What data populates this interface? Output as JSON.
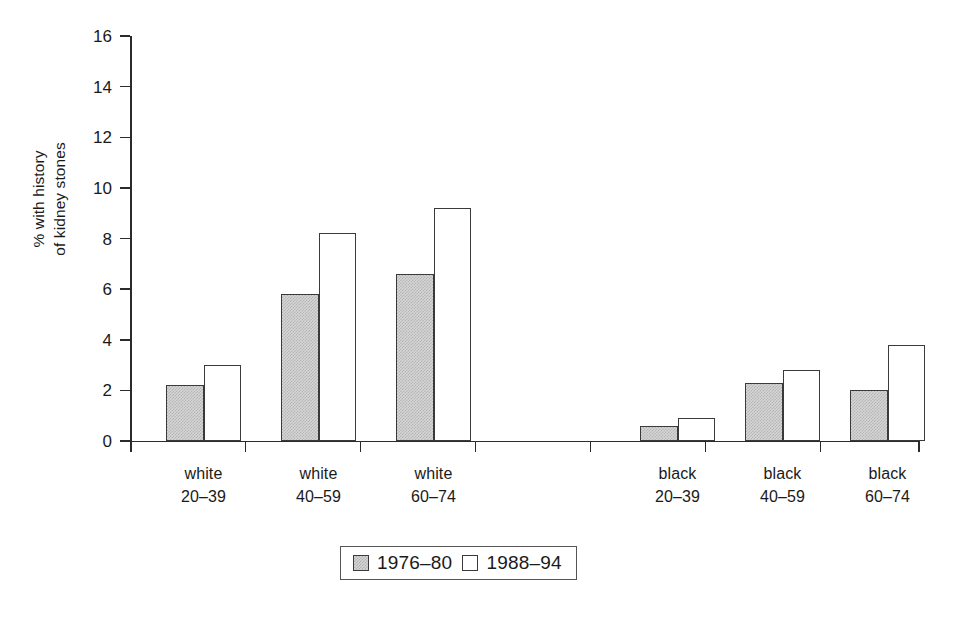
{
  "chart_data": {
    "type": "bar",
    "title": "",
    "subtitle": "",
    "xlabel": "",
    "ylabel_line1": "% with history",
    "ylabel_line2": "of kidney stones",
    "ylabel": "% with history of kidney stones",
    "ylim": [
      0,
      16
    ],
    "ytick_values": [
      0,
      2,
      4,
      6,
      8,
      10,
      12,
      14,
      16
    ],
    "ytick_labels": [
      "0",
      "2",
      "4",
      "6",
      "8",
      "10",
      "12",
      "14",
      "16"
    ],
    "grid": false,
    "legend_position": "bottom-center",
    "categories": [
      {
        "race": "white",
        "age": "20–39",
        "line1": "white",
        "line2": "20–39"
      },
      {
        "race": "white",
        "age": "40–59",
        "line1": "white",
        "line2": "40–59"
      },
      {
        "race": "white",
        "age": "60–74",
        "line1": "white",
        "line2": "60–74"
      },
      {
        "race": "black",
        "age": "20–39",
        "line1": "black",
        "line2": "20–39"
      },
      {
        "race": "black",
        "age": "40–59",
        "line1": "black",
        "line2": "40–59"
      },
      {
        "race": "black",
        "age": "60–74",
        "line1": "black",
        "line2": "60–74"
      }
    ],
    "category_labels": [
      "white 20–39",
      "white 40–59",
      "white 60–74",
      "black 20–39",
      "black 40–59",
      "black 60–74"
    ],
    "series": [
      {
        "name": "1976–80",
        "fill": "gray-stipple",
        "color": "#d6d6d6",
        "values": [
          2.2,
          5.8,
          6.6,
          0.6,
          2.3,
          2.0
        ]
      },
      {
        "name": "1988–94",
        "fill": "white",
        "color": "#ffffff",
        "values": [
          3.0,
          8.2,
          9.2,
          0.9,
          2.8,
          3.8
        ]
      }
    ]
  },
  "legend": {
    "entries": [
      {
        "label": "1976–80",
        "swatch": "gray-stipple"
      },
      {
        "label": "1988–94",
        "swatch": "white"
      }
    ]
  },
  "colors": {
    "axis": "#2b2b2b",
    "bar_outline": "#3a3a3a",
    "bar_gray": "#d6d6d6",
    "bar_white": "#ffffff",
    "text": "#1a1a1a",
    "background": "#ffffff"
  }
}
